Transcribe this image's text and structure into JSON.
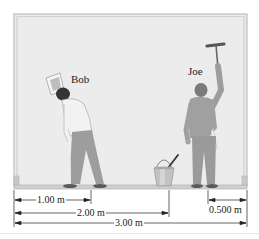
{
  "figure": {
    "people": [
      {
        "name": "Bob",
        "tool": "sponge"
      },
      {
        "name": "Joe",
        "tool": "squeegee"
      }
    ],
    "objects": [
      "bucket",
      "scaffold-plank",
      "wall"
    ],
    "dimensions": [
      {
        "label": "1.00 m",
        "from": "left support",
        "to": "Bob"
      },
      {
        "label": "2.00 m",
        "from": "left support",
        "to": "bucket"
      },
      {
        "label": "3.00 m",
        "from": "left support",
        "to": "right support"
      },
      {
        "label": "0.500 m",
        "from": "Joe",
        "to": "right support"
      }
    ]
  },
  "colors": {
    "wall": "#ebebeb",
    "frame": "#b5b5b5",
    "plank": "#cfcfcf",
    "figure": "#9a9a9a",
    "hair": "#333333",
    "ink": "#222222"
  }
}
